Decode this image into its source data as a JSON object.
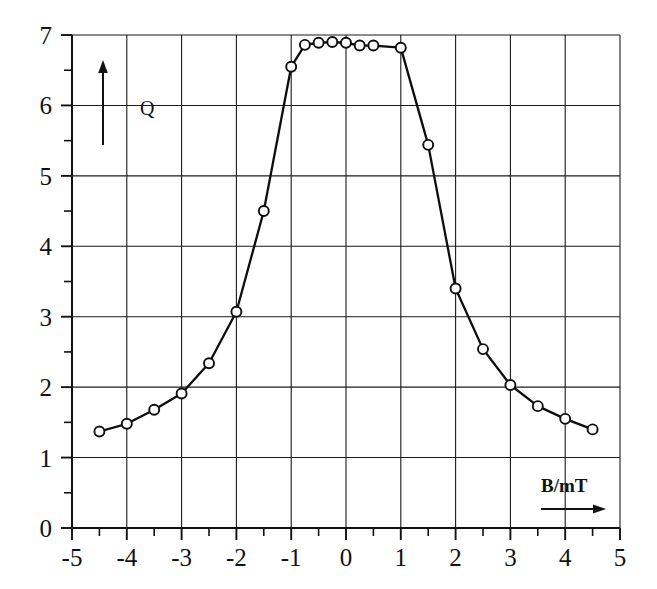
{
  "chart_data": {
    "type": "line",
    "title": "",
    "subtitle": "",
    "xlabel": "B/mT",
    "ylabel": "Q",
    "xlim": [
      -5,
      5
    ],
    "ylim": [
      0,
      7
    ],
    "grid": true,
    "legend": false,
    "legend_position": "none",
    "x_major_ticks": [
      -5,
      -4,
      -3,
      -2,
      -1,
      0,
      1,
      2,
      3,
      4,
      5
    ],
    "x_tick_labels": [
      "-5",
      "-4",
      "-3",
      "-2",
      "-1",
      "0",
      "1",
      "2",
      "3",
      "4",
      "5"
    ],
    "x_minor_ticks": [
      -4.5,
      -3.5,
      -2.5,
      -1.5,
      -0.5,
      0.5,
      1.5,
      2.5,
      3.5,
      4.5
    ],
    "y_major_ticks": [
      0,
      1,
      2,
      3,
      4,
      5,
      6,
      7
    ],
    "y_tick_labels": [
      "0",
      "1",
      "2",
      "3",
      "4",
      "5",
      "6",
      "7"
    ],
    "y_minor_ticks": [
      0.5,
      1.5,
      2.5,
      3.5,
      4.5,
      5.5,
      6.5
    ],
    "marker": "open-circle",
    "series": [
      {
        "name": "Q vs B",
        "x": [
          -4.5,
          -4.0,
          -3.5,
          -3.0,
          -2.5,
          -2.0,
          -1.5,
          -1.0,
          -0.75,
          -0.5,
          -0.25,
          0.0,
          0.25,
          0.5,
          1.0,
          1.5,
          2.0,
          2.5,
          3.0,
          3.5,
          4.0,
          4.5
        ],
        "y": [
          1.37,
          1.48,
          1.68,
          1.91,
          2.34,
          3.07,
          4.5,
          6.55,
          6.86,
          6.89,
          6.9,
          6.89,
          6.85,
          6.85,
          6.82,
          5.44,
          3.4,
          2.54,
          2.03,
          1.73,
          1.55,
          1.4
        ]
      }
    ]
  },
  "annotations": {
    "y_axis_arrow": "up-arrow",
    "x_axis_arrow": "right-arrow",
    "y_axis_symbol": "Q",
    "x_axis_symbol": "B/mT"
  },
  "colors": {
    "ink": "#111111",
    "grid": "#1a1a1a",
    "background": "#ffffff",
    "marker_fill": "#ffffff"
  }
}
